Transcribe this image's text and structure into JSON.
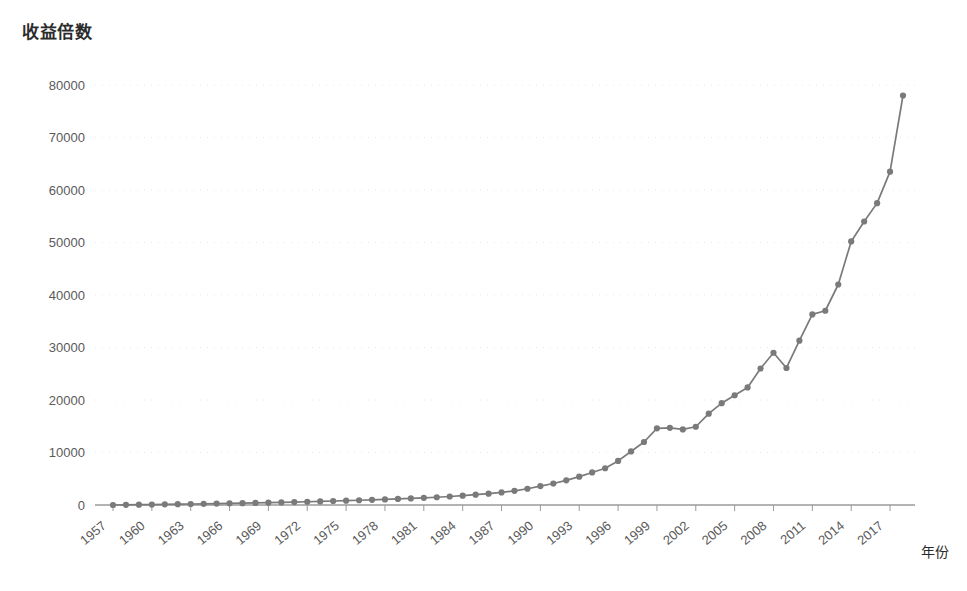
{
  "chart_data": {
    "type": "line",
    "title": "收益倍数",
    "xlabel": "年份",
    "ylabel": "",
    "xlim": [
      1957,
      2018
    ],
    "ylim": [
      0,
      80000
    ],
    "grid": true,
    "legend": false,
    "y_ticks": [
      0,
      10000,
      20000,
      30000,
      40000,
      50000,
      60000,
      70000,
      80000
    ],
    "y_tick_labels": [
      "0",
      "10000",
      "20000",
      "30000",
      "40000",
      "50000",
      "60000",
      "70000",
      "80000"
    ],
    "x_tick_labels": [
      "1957",
      "1960",
      "1963",
      "1966",
      "1969",
      "1972",
      "1975",
      "1978",
      "1981",
      "1984",
      "1987",
      "1990",
      "1993",
      "1996",
      "1999",
      "2002",
      "2005",
      "2008",
      "2011",
      "2014",
      "2017"
    ],
    "x": [
      1957,
      1958,
      1959,
      1960,
      1961,
      1962,
      1963,
      1964,
      1965,
      1966,
      1967,
      1968,
      1969,
      1970,
      1971,
      1972,
      1973,
      1974,
      1975,
      1976,
      1977,
      1978,
      1979,
      1980,
      1981,
      1982,
      1983,
      1984,
      1985,
      1986,
      1987,
      1988,
      1989,
      1990,
      1991,
      1992,
      1993,
      1994,
      1995,
      1996,
      1997,
      1998,
      1999,
      2000,
      2001,
      2002,
      2003,
      2004,
      2005,
      2006,
      2007,
      2008,
      2009,
      2010,
      2011,
      2012,
      2013,
      2014,
      2015,
      2016,
      2017,
      2018
    ],
    "values": [
      1,
      30,
      60,
      90,
      120,
      150,
      190,
      230,
      270,
      310,
      350,
      400,
      450,
      500,
      560,
      620,
      690,
      760,
      830,
      900,
      980,
      1060,
      1150,
      1250,
      1360,
      1480,
      1620,
      1780,
      1960,
      2150,
      2400,
      2700,
      3100,
      3600,
      4100,
      4700,
      5400,
      6200,
      7000,
      8400,
      10200,
      12000,
      14600,
      14700,
      14400,
      14900,
      17400,
      19400,
      20900,
      22400,
      26000,
      29000,
      26100,
      31300,
      36300,
      37000,
      42000,
      50200,
      54000,
      57500,
      63500,
      78000
    ],
    "colors": {
      "line": "#7a7a7a",
      "marker": "#7a7a7a",
      "axis": "#9a9a9a",
      "grid": "#e8e8e8",
      "tick_text": "#5a5a5a",
      "title_text": "#2b2b2b",
      "background": "#ffffff"
    }
  }
}
